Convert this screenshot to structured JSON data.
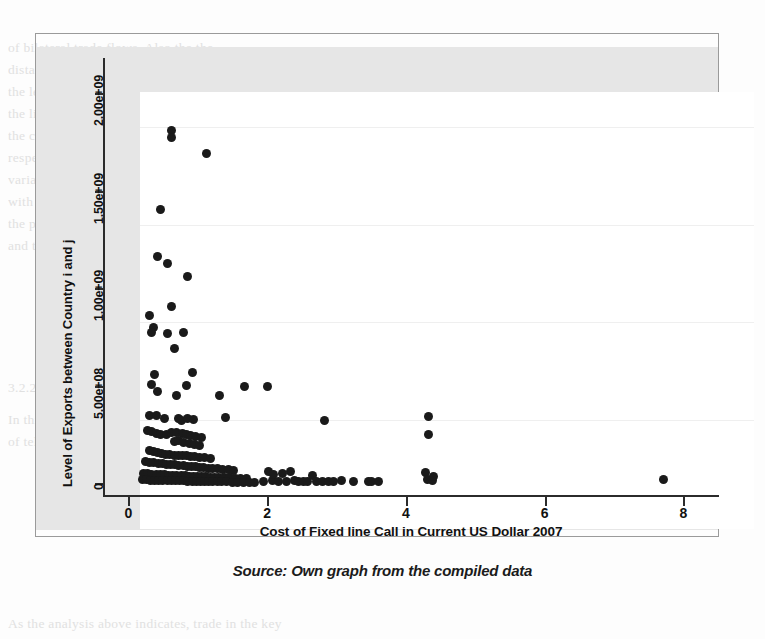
{
  "caption": "Source: Own graph from the compiled data",
  "background_text": [
    {
      "text": "of bilateral trade flows. Also the the",
      "x": 8,
      "y": 40
    },
    {
      "text": "distance between countries, the",
      "x": 8,
      "y": 62
    },
    {
      "text": "the level of trade. It is common in",
      "x": 8,
      "y": 84
    },
    {
      "text": "the literature to use a gravity",
      "x": 8,
      "y": 106
    },
    {
      "text": "the communication cost in the",
      "x": 8,
      "y": 128
    },
    {
      "text": "respectively. The first model of",
      "x": 8,
      "y": 150
    },
    {
      "text": "variable in bilateral trade flows",
      "x": 8,
      "y": 172
    },
    {
      "text": "with a combined effect across the",
      "x": 8,
      "y": 194
    },
    {
      "text": "the possible relationship between",
      "x": 8,
      "y": 216
    },
    {
      "text": "and the general outcomes.",
      "x": 8,
      "y": 238
    },
    {
      "text": "3.2.2.",
      "x": 8,
      "y": 380
    },
    {
      "text": "In this section the estimation of the",
      "x": 8,
      "y": 412
    },
    {
      "text": "of telecommunication on trade flows",
      "x": 8,
      "y": 434
    },
    {
      "text": "As the analysis above indicates, trade in the key",
      "x": 8,
      "y": 616
    }
  ],
  "chart_data": {
    "type": "scatter",
    "title": "",
    "xlabel": "Cost of Fixed line Call in Current US Dollar 2007",
    "ylabel": "Level of Exports between  Country i and j",
    "xlim": [
      -0.35,
      8.5
    ],
    "ylim": [
      -60000000,
      2180000000
    ],
    "xticks": [
      0,
      2,
      4,
      6,
      8
    ],
    "xticklabels": [
      "0",
      "2",
      "4",
      "6",
      "8"
    ],
    "yticks": [
      0,
      500000000,
      1000000000,
      1500000000,
      2000000000
    ],
    "yticklabels": [
      "0",
      "5.00e+08",
      "1.00e+09",
      "1.50e+09",
      "2.00e+09"
    ],
    "grid": true,
    "legend": "none",
    "marker": "filled-circle",
    "marker_color": "#1a1a1a",
    "points": [
      [
        0.62,
        1810000000
      ],
      [
        0.63,
        1775000000
      ],
      [
        1.13,
        1690000000
      ],
      [
        0.47,
        1405000000
      ],
      [
        0.42,
        1160000000
      ],
      [
        0.56,
        1125000000
      ],
      [
        0.86,
        1060000000
      ],
      [
        0.62,
        905000000
      ],
      [
        0.3,
        860000000
      ],
      [
        0.36,
        800000000
      ],
      [
        0.33,
        775000000
      ],
      [
        0.56,
        770000000
      ],
      [
        0.8,
        775000000
      ],
      [
        0.66,
        690000000
      ],
      [
        0.38,
        560000000
      ],
      [
        0.92,
        570000000
      ],
      [
        0.34,
        505000000
      ],
      [
        0.84,
        500000000
      ],
      [
        1.68,
        495000000
      ],
      [
        2.0,
        495000000
      ],
      [
        0.42,
        470000000
      ],
      [
        0.69,
        450000000
      ],
      [
        1.32,
        450000000
      ],
      [
        0.3,
        345000000
      ],
      [
        0.41,
        345000000
      ],
      [
        1.4,
        335000000
      ],
      [
        0.52,
        330000000
      ],
      [
        0.72,
        330000000
      ],
      [
        0.76,
        320000000
      ],
      [
        0.86,
        330000000
      ],
      [
        0.94,
        325000000
      ],
      [
        2.83,
        320000000
      ],
      [
        4.33,
        340000000
      ],
      [
        4.33,
        250000000
      ],
      [
        0.27,
        270000000
      ],
      [
        0.33,
        265000000
      ],
      [
        0.4,
        255000000
      ],
      [
        0.47,
        250000000
      ],
      [
        0.55,
        250000000
      ],
      [
        0.62,
        260000000
      ],
      [
        0.7,
        262000000
      ],
      [
        0.78,
        255000000
      ],
      [
        0.84,
        250000000
      ],
      [
        0.9,
        245000000
      ],
      [
        0.97,
        240000000
      ],
      [
        1.05,
        235000000
      ],
      [
        0.67,
        215000000
      ],
      [
        0.73,
        220000000
      ],
      [
        0.8,
        210000000
      ],
      [
        0.88,
        205000000
      ],
      [
        0.95,
        200000000
      ],
      [
        1.02,
        195000000
      ],
      [
        0.3,
        170000000
      ],
      [
        0.36,
        165000000
      ],
      [
        0.42,
        160000000
      ],
      [
        0.48,
        155000000
      ],
      [
        0.54,
        150000000
      ],
      [
        0.6,
        150000000
      ],
      [
        0.66,
        145000000
      ],
      [
        0.72,
        145000000
      ],
      [
        0.78,
        140000000
      ],
      [
        0.84,
        140000000
      ],
      [
        0.9,
        135000000
      ],
      [
        0.96,
        135000000
      ],
      [
        1.02,
        130000000
      ],
      [
        1.1,
        130000000
      ],
      [
        1.18,
        125000000
      ],
      [
        0.25,
        110000000
      ],
      [
        0.31,
        108000000
      ],
      [
        0.37,
        105000000
      ],
      [
        0.43,
        103000000
      ],
      [
        0.49,
        100000000
      ],
      [
        0.55,
        98000000
      ],
      [
        0.61,
        96000000
      ],
      [
        0.67,
        95000000
      ],
      [
        0.73,
        93000000
      ],
      [
        0.79,
        90000000
      ],
      [
        0.85,
        88000000
      ],
      [
        0.91,
        86000000
      ],
      [
        0.97,
        84000000
      ],
      [
        1.03,
        82000000
      ],
      [
        1.09,
        80000000
      ],
      [
        1.15,
        78000000
      ],
      [
        1.22,
        76000000
      ],
      [
        1.29,
        74000000
      ],
      [
        1.36,
        72000000
      ],
      [
        1.44,
        70000000
      ],
      [
        1.52,
        68000000
      ],
      [
        0.22,
        50000000
      ],
      [
        0.28,
        48000000
      ],
      [
        0.34,
        46000000
      ],
      [
        0.4,
        45000000
      ],
      [
        0.46,
        44000000
      ],
      [
        0.52,
        43000000
      ],
      [
        0.58,
        42000000
      ],
      [
        0.64,
        41000000
      ],
      [
        0.7,
        40000000
      ],
      [
        0.76,
        39000000
      ],
      [
        0.82,
        38000000
      ],
      [
        0.88,
        37000000
      ],
      [
        0.94,
        36000000
      ],
      [
        1.0,
        35000000
      ],
      [
        1.06,
        34000000
      ],
      [
        1.12,
        33000000
      ],
      [
        1.18,
        32000000
      ],
      [
        1.24,
        31000000
      ],
      [
        1.3,
        30000000
      ],
      [
        1.38,
        29000000
      ],
      [
        1.46,
        28000000
      ],
      [
        1.54,
        27000000
      ],
      [
        1.62,
        26000000
      ],
      [
        1.7,
        25000000
      ],
      [
        0.2,
        18000000
      ],
      [
        0.26,
        17000000
      ],
      [
        0.32,
        16000000
      ],
      [
        0.38,
        15000000
      ],
      [
        0.44,
        15000000
      ],
      [
        0.5,
        14000000
      ],
      [
        0.56,
        14000000
      ],
      [
        0.62,
        13000000
      ],
      [
        0.68,
        13000000
      ],
      [
        0.74,
        12000000
      ],
      [
        0.8,
        12000000
      ],
      [
        0.86,
        11000000
      ],
      [
        0.92,
        11000000
      ],
      [
        0.98,
        10000000
      ],
      [
        1.04,
        10000000
      ],
      [
        1.1,
        9000000
      ],
      [
        1.16,
        9000000
      ],
      [
        1.22,
        8000000
      ],
      [
        1.28,
        8000000
      ],
      [
        1.34,
        7000000
      ],
      [
        1.42,
        7000000
      ],
      [
        1.5,
        6000000
      ],
      [
        1.58,
        6000000
      ],
      [
        1.66,
        6000000
      ],
      [
        1.74,
        5000000
      ],
      [
        1.82,
        5000000
      ],
      [
        1.95,
        10000000
      ],
      [
        2.02,
        60000000
      ],
      [
        2.08,
        12000000
      ],
      [
        2.1,
        45000000
      ],
      [
        2.16,
        8000000
      ],
      [
        2.22,
        50000000
      ],
      [
        2.28,
        10000000
      ],
      [
        2.34,
        60000000
      ],
      [
        2.4,
        12000000
      ],
      [
        2.46,
        8000000
      ],
      [
        2.52,
        9000000
      ],
      [
        2.58,
        7000000
      ],
      [
        2.66,
        40000000
      ],
      [
        2.72,
        10000000
      ],
      [
        2.8,
        8000000
      ],
      [
        2.88,
        9000000
      ],
      [
        2.96,
        7000000
      ],
      [
        3.08,
        12000000
      ],
      [
        3.24,
        10000000
      ],
      [
        3.46,
        9000000
      ],
      [
        3.5,
        8000000
      ],
      [
        3.6,
        7000000
      ],
      [
        4.28,
        55000000
      ],
      [
        4.32,
        20000000
      ],
      [
        4.38,
        12000000
      ],
      [
        4.4,
        35000000
      ],
      [
        7.72,
        22000000
      ]
    ]
  },
  "axes": {
    "y_title": "Level of Exports between  Country i and j",
    "x_title": "Cost of Fixed line Call in Current US Dollar 2007"
  }
}
